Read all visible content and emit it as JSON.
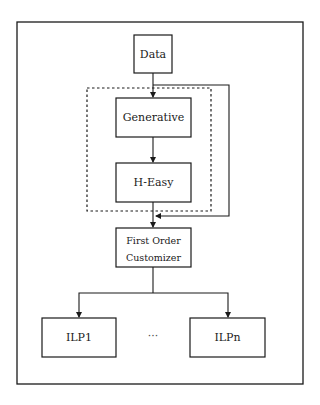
{
  "diagram": {
    "nodes": {
      "data": {
        "label": "Data"
      },
      "generative": {
        "label": "Generative"
      },
      "h_easy": {
        "label": "H-Easy"
      },
      "customizer": {
        "line1": "First Order",
        "line2": "Customizer"
      },
      "ilp1": {
        "label": "ILP1"
      },
      "ilpn": {
        "label": "ILPn"
      }
    },
    "ellipsis": "···",
    "edges": [
      {
        "from": "Data",
        "to": "Generative"
      },
      {
        "from": "Generative",
        "to": "H-Easy"
      },
      {
        "from": "H-Easy",
        "to": "First Order Customizer"
      },
      {
        "from": "Data",
        "to": "First Order Customizer",
        "style": "bypass"
      },
      {
        "from": "First Order Customizer",
        "to": "ILP1"
      },
      {
        "from": "First Order Customizer",
        "to": "ILPn"
      }
    ],
    "group": {
      "style": "dashed",
      "contains": [
        "Generative",
        "H-Easy"
      ]
    },
    "colors": {
      "stroke": "#1a1a1a",
      "background": "#ffffff"
    }
  }
}
